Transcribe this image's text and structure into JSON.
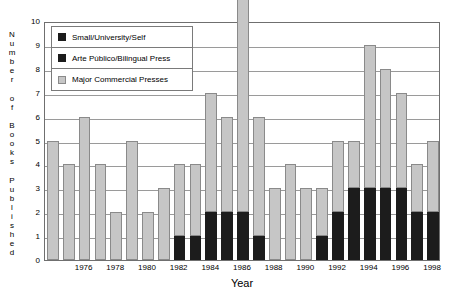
{
  "chart_data": {
    "type": "bar",
    "stacked": true,
    "title": "",
    "xlabel": "Year",
    "ylabel": "Number of Books Published",
    "ylabel_letters": [
      "N",
      "u",
      "m",
      "b",
      "e",
      "r",
      "",
      "o",
      "f",
      "",
      "B",
      "o",
      "o",
      "k",
      "s",
      "",
      "P",
      "u",
      "b",
      "l",
      "i",
      "s",
      "h",
      "e",
      "d"
    ],
    "ylim": [
      0,
      10
    ],
    "yticks": [
      0,
      1,
      2,
      3,
      4,
      5,
      6,
      7,
      8,
      9,
      10
    ],
    "grid": true,
    "legend_position": "upper-left",
    "categories": [
      1974,
      1975,
      1976,
      1977,
      1978,
      1979,
      1980,
      1981,
      1982,
      1983,
      1984,
      1985,
      1986,
      1987,
      1988,
      1989,
      1990,
      1991,
      1992,
      1993,
      1994,
      1995,
      1996,
      1997,
      1998
    ],
    "xtick_labels": [
      "1976",
      "1978",
      "1980",
      "1982",
      "1984",
      "1986",
      "1988",
      "1990",
      "1992",
      "1994",
      "1996",
      "1998"
    ],
    "xtick_categories": [
      1976,
      1978,
      1980,
      1982,
      1984,
      1986,
      1988,
      1990,
      1992,
      1994,
      1996,
      1998
    ],
    "series": [
      {
        "name": "Major Commercial Presses",
        "color": "#c6c6c6",
        "values": [
          0,
          0,
          0,
          0,
          0,
          0,
          0,
          0,
          1,
          1,
          2,
          2,
          2,
          1,
          0,
          0,
          0,
          1,
          2,
          3,
          3,
          3,
          3,
          2,
          2
        ]
      },
      {
        "name": "Arte Público/Bilingual Press",
        "color": "#1c1c1c",
        "values": [
          0,
          0,
          0,
          0,
          0,
          0,
          0,
          0,
          0,
          0,
          0,
          0,
          0,
          0,
          0,
          0,
          0,
          0,
          0,
          0,
          0,
          0,
          0,
          0,
          0
        ]
      },
      {
        "name": "Small/University/Self",
        "color": "#1c1c1c",
        "values": [
          5,
          4,
          6,
          4,
          2,
          5,
          2,
          3,
          3,
          3,
          5,
          4,
          9,
          5,
          3,
          4,
          3,
          2,
          3,
          2,
          6,
          5,
          4,
          2,
          3
        ]
      }
    ],
    "totals": [
      5,
      4,
      6,
      4,
      2,
      5,
      2,
      3,
      4,
      4,
      7,
      6,
      11,
      6,
      3,
      4,
      3,
      3,
      5,
      5,
      9,
      8,
      7,
      4,
      5
    ]
  },
  "legend": {
    "items": [
      {
        "label": "Small/University/Self",
        "swatch": "legend-swatch-dark"
      },
      {
        "label": "Arte Público/Bilingual Press",
        "swatch": "legend-swatch-dark"
      },
      {
        "label": "Major Commercial Presses",
        "swatch": "legend-swatch-gray"
      }
    ]
  }
}
